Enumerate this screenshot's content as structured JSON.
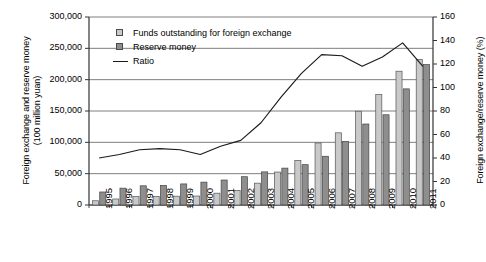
{
  "chart_data": {
    "type": "bar",
    "title": "",
    "subtitle": "",
    "xlabel": "",
    "ylabel": "Foreign exchange and reserve money\n(100 million yuan)",
    "ylabel_right": "Foreign exchange/reserve money (%)",
    "grid": true,
    "legend_position": "top-left-inside",
    "categories": [
      "1995",
      "1996",
      "1997",
      "1998",
      "1999",
      "2000",
      "2001",
      "2002",
      "2003",
      "2004",
      "2005",
      "2006",
      "2007",
      "2008",
      "2009",
      "2010",
      "2011"
    ],
    "ylim": [
      0,
      300000
    ],
    "yticks": [
      0,
      50000,
      100000,
      150000,
      200000,
      250000,
      300000
    ],
    "ytick_labels": [
      "0",
      "50,000",
      "100,000",
      "150,000",
      "200,000",
      "250,000",
      "300,000"
    ],
    "ylim_right": [
      0,
      160
    ],
    "yticks_right": [
      0,
      20,
      40,
      60,
      80,
      100,
      120,
      140,
      160
    ],
    "ytick_labels_right": [
      "0",
      "20",
      "40",
      "60",
      "80",
      "100",
      "120",
      "140",
      "160"
    ],
    "series": [
      {
        "name": "Funds outstanding for foreign exchange",
        "type": "bar",
        "axis": "left",
        "color": "#c9c9c9",
        "edge_color": "#555555",
        "values": [
          6774,
          9579,
          13467,
          13728,
          14061,
          14291,
          18850,
          23223,
          34847,
          52592,
          71211,
          99000,
          115169,
          149624,
          176207,
          213478,
          232400
        ]
      },
      {
        "name": "Reserve money",
        "type": "bar",
        "axis": "left",
        "color": "#8e8e8e",
        "edge_color": "#444444",
        "values": [
          20760,
          26889,
          30633,
          31335,
          33620,
          36491,
          39852,
          45138,
          52841,
          58856,
          64343,
          77758,
          101545,
          129222,
          143985,
          185311,
          224000
        ]
      },
      {
        "name": "Ratio",
        "type": "line",
        "axis": "right",
        "color": "#1a1a1a",
        "values": [
          40,
          43,
          47,
          48,
          47,
          43,
          50,
          55,
          70,
          92,
          112,
          128,
          127,
          118,
          126,
          138,
          118
        ]
      }
    ],
    "legend": [
      {
        "label": "Funds outstanding for foreign exchange",
        "marker": "square-light"
      },
      {
        "label": "Reserve money",
        "marker": "square-dark"
      },
      {
        "label": "Ratio",
        "marker": "line"
      }
    ]
  },
  "colors": {
    "light_bar": "#c9c9c9",
    "dark_bar": "#8e8e8e",
    "line": "#1a1a1a",
    "grid": "#6f6f6f",
    "axis": "#333333"
  }
}
